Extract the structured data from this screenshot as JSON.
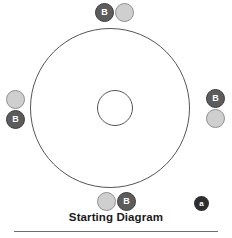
{
  "figure": {
    "caption": "Starting Diagram",
    "colors": {
      "dark_token_fill": "#5c5c5c",
      "dark_token_border": "#3b3b3b",
      "light_token_fill": "#cfcfcf",
      "light_token_border": "#8f8f8f",
      "circle_stroke": "#555555",
      "marker_fill": "#2e2e2e",
      "rule": "#6e6e6e",
      "background": "#ffffff"
    },
    "shapes": {
      "outer_circle": {
        "label": "outer-ring",
        "cx": 110,
        "cy": 108,
        "r": 80
      },
      "inner_circle": {
        "label": "hub",
        "cx": 115,
        "cy": 108,
        "r": 18
      }
    },
    "tokens": [
      {
        "id": "top-dark",
        "label": "B",
        "style": "dark",
        "position": "top-left-of-pair",
        "x": 95,
        "y": 3
      },
      {
        "id": "top-light",
        "label": "",
        "style": "light",
        "position": "top-right-of-pair",
        "x": 115,
        "y": 3
      },
      {
        "id": "left-light",
        "label": "",
        "style": "light",
        "position": "left-upper",
        "x": 6,
        "y": 90
      },
      {
        "id": "left-dark",
        "label": "B",
        "style": "dark",
        "position": "left-lower",
        "x": 6,
        "y": 110
      },
      {
        "id": "right-dark",
        "label": "B",
        "style": "dark",
        "position": "right-upper",
        "x": 206,
        "y": 89
      },
      {
        "id": "right-light",
        "label": "",
        "style": "light",
        "position": "right-lower",
        "x": 206,
        "y": 109
      },
      {
        "id": "bottom-light",
        "label": "",
        "style": "light",
        "position": "bottom-left-of-pair",
        "x": 97,
        "y": 192
      },
      {
        "id": "bottom-dark",
        "label": "B",
        "style": "dark",
        "position": "bottom-right-of-pair",
        "x": 117,
        "y": 192
      }
    ],
    "marker": {
      "id": "marker-a",
      "label": "a"
    }
  }
}
